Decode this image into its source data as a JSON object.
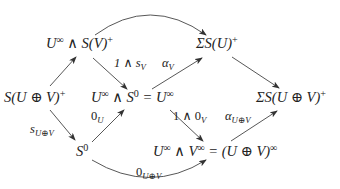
{
  "diagram": {
    "type": "commutative-diagram",
    "nodes": [
      {
        "id": "n1",
        "label": "U^∞ ∧ S(V)^+"
      },
      {
        "id": "n2",
        "label": "ΣS(U)^+"
      },
      {
        "id": "n3",
        "label": "S(U ⊕ V)^+"
      },
      {
        "id": "n4",
        "label": "U^∞ ∧ S^0 = U^∞"
      },
      {
        "id": "n5",
        "label": "ΣS(U ⊕ V)^+"
      },
      {
        "id": "n6",
        "label": "S^0"
      },
      {
        "id": "n7",
        "label": "U^∞ ∧ V^∞ = (U ⊕ V)^∞"
      }
    ],
    "edges": [
      {
        "from": "n3",
        "to": "n1",
        "label": ""
      },
      {
        "from": "n1",
        "to": "n4",
        "label": "1 ∧ s_V"
      },
      {
        "from": "n4",
        "to": "n2",
        "label": "α_V"
      },
      {
        "from": "n1",
        "to": "n2",
        "label": "",
        "curved": true
      },
      {
        "from": "n2",
        "to": "n5",
        "label": ""
      },
      {
        "from": "n3",
        "to": "n6",
        "label": "s_{U⊕V}"
      },
      {
        "from": "n6",
        "to": "n4",
        "label": "0_U"
      },
      {
        "from": "n4",
        "to": "n7",
        "label": "1 ∧ 0_V"
      },
      {
        "from": "n7",
        "to": "n5",
        "label": "α_{U⊕V}"
      },
      {
        "from": "n6",
        "to": "n7",
        "label": "0_{U⊕V}",
        "curved": true
      }
    ]
  },
  "nodes": {
    "n1": {
      "a": "U",
      "a_sup": "∞",
      "b": " ∧ S(V)",
      "b_sup": "+"
    },
    "n2": {
      "a": "ΣS(U)",
      "a_sup": "+"
    },
    "n3": {
      "a": "S(U ⊕ V)",
      "a_sup": "+"
    },
    "n4": {
      "a": "U",
      "a_sup": "∞",
      "b": " ∧ S",
      "b_sup": "0",
      "c": " = U",
      "c_sup": "∞"
    },
    "n5": {
      "a": "ΣS(U ⊕ V)",
      "a_sup": "+"
    },
    "n6": {
      "a": "S",
      "a_sup": "0"
    },
    "n7": {
      "a": "U",
      "a_sup": "∞",
      "b": " ∧ V",
      "b_sup": "∞",
      "c": " = (U ⊕ V)",
      "c_sup": "∞"
    }
  },
  "labels": {
    "one_wedge_sv": {
      "a": "1 ∧ s",
      "a_sub": "V"
    },
    "alpha_v": {
      "a": "α",
      "a_sub": "V"
    },
    "s_uv": {
      "a": "s",
      "a_sub": "U⊕V"
    },
    "zero_u": {
      "a": "0",
      "a_sub": "U"
    },
    "one_wedge_0v": {
      "a": "1 ∧ 0",
      "a_sub": "V"
    },
    "alpha_uv": {
      "a": "α",
      "a_sub": "U⊕V"
    },
    "zero_uv": {
      "a": "0",
      "a_sub": "U⊕V"
    }
  },
  "colors": {
    "ink": "#222222",
    "background": "#ffffff"
  }
}
